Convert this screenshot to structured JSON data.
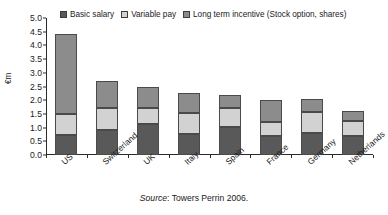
{
  "chart_data": {
    "type": "bar",
    "subtype": "stacked-vertical",
    "title": "",
    "xlabel": "",
    "ylabel": "€m",
    "ylim": [
      0.0,
      5.0
    ],
    "ytick_step": 0.5,
    "ytick_labels": [
      "0.0",
      "0.5",
      "1.0",
      "1.5",
      "2.0",
      "2.5",
      "3.0",
      "3.5",
      "4.0",
      "4.5",
      "5.0"
    ],
    "grid": false,
    "legend_position": "top",
    "categories": [
      "US",
      "Switzerland",
      "UK",
      "Italy",
      "Spain",
      "France",
      "Germany",
      "Netherlands"
    ],
    "series": [
      {
        "name": "Basic salary",
        "color": "#595959",
        "values": [
          0.73,
          0.91,
          1.15,
          0.76,
          1.02,
          0.68,
          0.79,
          0.71
        ]
      },
      {
        "name": "Variable pay",
        "color": "#d2d2d2",
        "values": [
          0.77,
          0.8,
          0.56,
          0.79,
          0.7,
          0.52,
          0.79,
          0.52
        ]
      },
      {
        "name": "Long term incentive (Stock option, shares)",
        "color": "#8c8c8c",
        "values": [
          2.93,
          0.99,
          0.79,
          0.7,
          0.48,
          0.8,
          0.47,
          0.37
        ]
      }
    ],
    "totals": [
      4.43,
      2.7,
      2.5,
      2.25,
      2.2,
      2.0,
      2.05,
      1.6
    ],
    "cumulative_tops": [
      [
        0.73,
        1.5,
        4.43
      ],
      [
        0.91,
        1.71,
        2.7
      ],
      [
        1.15,
        1.71,
        2.5
      ],
      [
        0.76,
        1.55,
        2.25
      ],
      [
        1.02,
        1.72,
        2.2
      ],
      [
        0.68,
        1.2,
        2.0
      ],
      [
        0.79,
        1.58,
        2.05
      ],
      [
        0.71,
        1.23,
        1.6
      ]
    ]
  },
  "legend": {
    "entries": [
      {
        "label": "Basic salary",
        "color": "#595959"
      },
      {
        "label": "Variable pay",
        "color": "#d2d2d2"
      },
      {
        "label": "Long term incentive (Stock option, shares)",
        "color": "#8c8c8c"
      }
    ]
  },
  "source_note": {
    "prefix": "Source",
    "text": ": Towers Perrin 2006."
  }
}
